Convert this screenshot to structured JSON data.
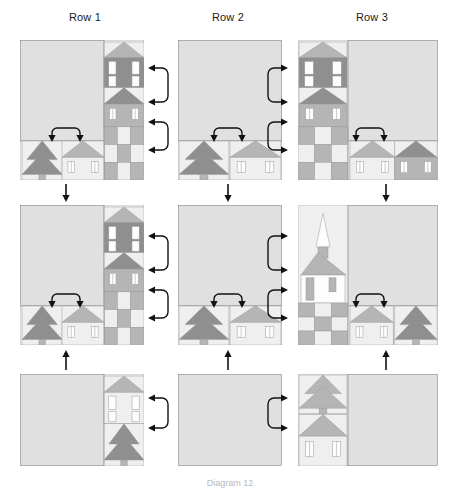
{
  "figure": {
    "type": "quilt-assembly-diagram",
    "title_row_labels": [
      "Row 1",
      "Row 2",
      "Row 3"
    ],
    "caption": "Diagram 12",
    "grid": {
      "columns": 3,
      "rows": 3
    }
  },
  "palette": {
    "background": "#ffffff",
    "sky": "#e0e0e0",
    "light": "#efefef",
    "white": "#fdfdfd",
    "medium": "#b5b5b5",
    "dark": "#8f8f8f",
    "outline": "#6e6e6e",
    "gridline": "#9a9a9a",
    "arrow": "#111111",
    "text": "#1a1a1a",
    "caption_text": "#b9b9b9"
  },
  "columns": [
    {
      "id": "row-1",
      "label": "Row 1",
      "label_x": 85,
      "label_y": 22,
      "blocks": [
        {
          "id": "r1-b1",
          "x": 20,
          "y": 40,
          "w": 124,
          "h": 140,
          "kind": "sky-left-houses-right",
          "sky_w": 84
        },
        {
          "id": "r1-b2",
          "x": 20,
          "y": 205,
          "w": 124,
          "h": 140,
          "kind": "sky-left-houses-right",
          "sky_w": 84
        },
        {
          "id": "r1-b3",
          "x": 20,
          "y": 374,
          "w": 124,
          "h": 92,
          "kind": "sky-left-tall-house",
          "sky_w": 84
        }
      ],
      "side_arrows": [
        {
          "x": 150,
          "y": 68,
          "h": 34,
          "dir": "left"
        },
        {
          "x": 150,
          "y": 122,
          "h": 28,
          "dir": "left"
        },
        {
          "x": 150,
          "y": 236,
          "h": 34,
          "dir": "left"
        },
        {
          "x": 150,
          "y": 290,
          "h": 28,
          "dir": "left"
        },
        {
          "x": 150,
          "y": 398,
          "h": 30,
          "dir": "left"
        }
      ],
      "down_arrows": [
        {
          "x": 66,
          "y": 184,
          "len": 18
        },
        {
          "x": 66,
          "y": 350,
          "len": 20,
          "dir": "up"
        }
      ],
      "inner_arrows": [
        {
          "x": 52,
          "y": 124,
          "w": 28
        },
        {
          "x": 52,
          "y": 290,
          "w": 28
        }
      ]
    },
    {
      "id": "row-2",
      "label": "Row 2",
      "label_x": 228,
      "label_y": 22,
      "blocks": [
        {
          "id": "r2-b1",
          "x": 178,
          "y": 40,
          "w": 104,
          "h": 140,
          "kind": "sky-top-houses-bottom"
        },
        {
          "id": "r2-b2",
          "x": 178,
          "y": 205,
          "w": 104,
          "h": 140,
          "kind": "sky-top-houses-bottom"
        },
        {
          "id": "r2-b3",
          "x": 178,
          "y": 374,
          "w": 104,
          "h": 92,
          "kind": "plain-sky"
        }
      ],
      "side_arrows": [],
      "down_arrows": [
        {
          "x": 228,
          "y": 184,
          "len": 18
        },
        {
          "x": 228,
          "y": 350,
          "len": 20,
          "dir": "up"
        }
      ],
      "inner_arrows": [
        {
          "x": 214,
          "y": 124,
          "w": 28
        },
        {
          "x": 214,
          "y": 290,
          "w": 28
        }
      ]
    },
    {
      "id": "row-3",
      "label": "Row 3",
      "label_x": 372,
      "label_y": 22,
      "blocks": [
        {
          "id": "r3-b1",
          "x": 298,
          "y": 40,
          "w": 140,
          "h": 140,
          "kind": "houses-left-sky-right",
          "strip_w": 50
        },
        {
          "id": "r3-b2",
          "x": 298,
          "y": 205,
          "w": 140,
          "h": 140,
          "kind": "church-left-sky-right",
          "strip_w": 50
        },
        {
          "id": "r3-b3",
          "x": 298,
          "y": 374,
          "w": 140,
          "h": 92,
          "kind": "house-left-sky-right",
          "strip_w": 50
        }
      ],
      "side_arrows": [
        {
          "x": 286,
          "y": 68,
          "h": 34,
          "dir": "right"
        },
        {
          "x": 286,
          "y": 122,
          "h": 28,
          "dir": "right"
        },
        {
          "x": 286,
          "y": 236,
          "h": 34,
          "dir": "right"
        },
        {
          "x": 286,
          "y": 290,
          "h": 28,
          "dir": "right"
        },
        {
          "x": 286,
          "y": 398,
          "h": 30,
          "dir": "right"
        }
      ],
      "down_arrows": [
        {
          "x": 386,
          "y": 184,
          "len": 18
        },
        {
          "x": 386,
          "y": 350,
          "len": 20,
          "dir": "up"
        }
      ],
      "inner_arrows": [
        {
          "x": 356,
          "y": 124,
          "w": 28
        },
        {
          "x": 356,
          "y": 290,
          "w": 28
        }
      ]
    }
  ]
}
